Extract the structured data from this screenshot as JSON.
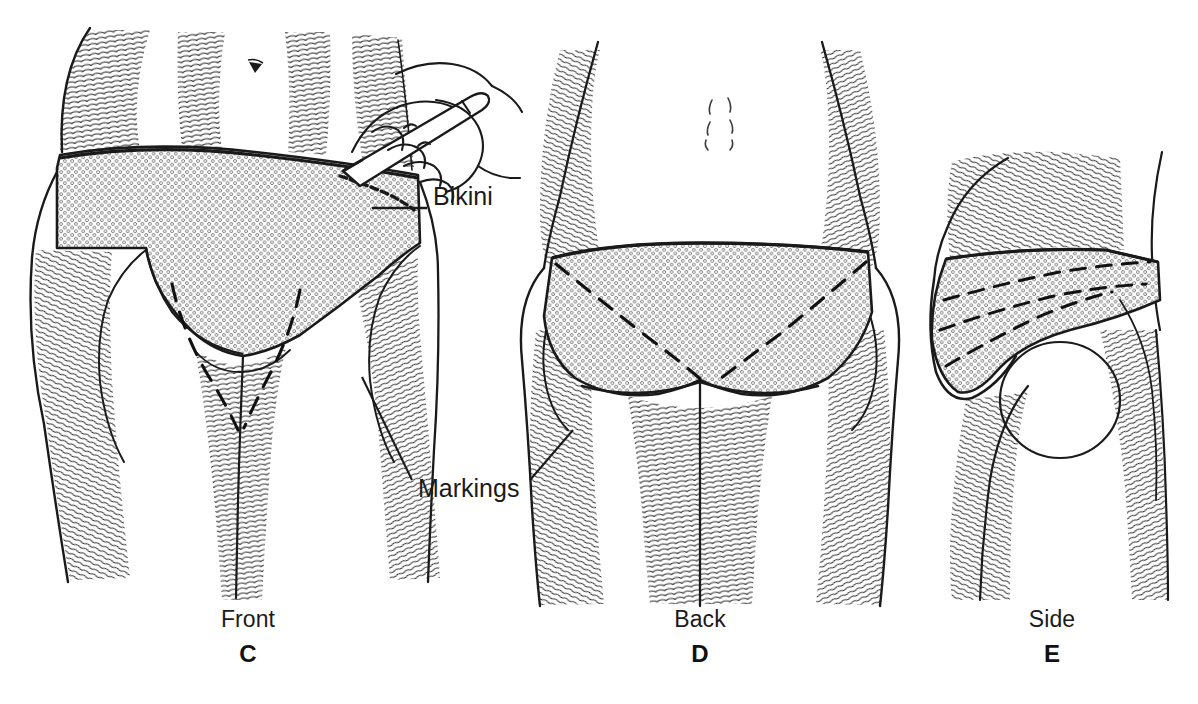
{
  "figure": {
    "title_implicit": "Bikini line markings for liposuction / body contouring",
    "background_color": "#ffffff",
    "ink_color": "#1a1a1a",
    "stipple_color": "#6b6b6b",
    "panels": [
      {
        "id": "C",
        "panel_letter": "C",
        "view_caption": "Front",
        "caption_x": 248,
        "caption_y": 618,
        "letter_x": 248,
        "letter_y": 652,
        "description": "Anterior view of lower abdomen, groin and upper thighs; stippled bikini garment outlined; hand holding a surgical marking pen draws on the left hip; dashed curved markings lie in both groin creases.",
        "has_hand_with_pen": true,
        "dashed_markings": 2
      },
      {
        "id": "D",
        "panel_letter": "D",
        "view_caption": "Back",
        "caption_x": 700,
        "caption_y": 618,
        "letter_x": 700,
        "letter_y": 652,
        "description": "Posterior view of buttocks and upper thighs; stippled bikini bottom with dashed oblique markings crossing each buttock; sacral dimples visible above the waist.",
        "has_hand_with_pen": false,
        "dashed_markings": 2
      },
      {
        "id": "E",
        "panel_letter": "E",
        "view_caption": "Side",
        "caption_x": 1052,
        "caption_y": 618,
        "letter_x": 1052,
        "letter_y": 652,
        "description": "Lateral view of hip and buttock; stippled bikini with dashed marking lines running obliquely across the flank and trochanteric region.",
        "has_hand_with_pen": false,
        "dashed_markings": 3
      }
    ],
    "annotations": [
      {
        "name": "bikini",
        "text": "Bikini",
        "text_x": 433,
        "text_y": 196,
        "leader": {
          "x1": 427,
          "y1": 208,
          "x2": 372,
          "y2": 208
        },
        "points_to": "stippled bikini garment on the front view"
      },
      {
        "name": "markings",
        "text": "Markings",
        "text_x": 418,
        "text_y": 487,
        "leaders": [
          {
            "x1": 412,
            "y1": 480,
            "x2": 362,
            "y2": 377
          },
          {
            "x1": 530,
            "y1": 480,
            "x2": 573,
            "y2": 430
          }
        ],
        "points_to": "dashed pen markings on the front and back views"
      }
    ]
  }
}
